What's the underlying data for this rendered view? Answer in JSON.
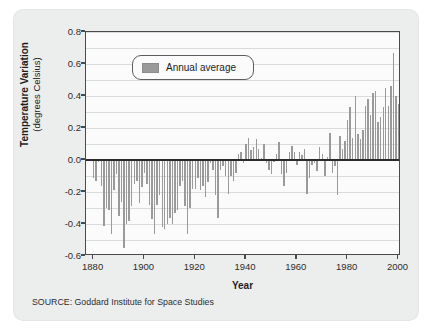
{
  "figure": {
    "source_note": "SOURCE: Goddard Institute for Space Studies",
    "legend_label": "Annual average",
    "y_title_main": "Temperature Variation",
    "y_title_sub": "(degrees Celsius)",
    "x_title": "Year",
    "bar_color": "#9a9a9a",
    "zero_line_color": "#2b2b2b",
    "grid_color": "#d9dcdd",
    "card_color": "#eceded",
    "plot_bg": "#fbfbfb"
  },
  "chart_data": {
    "type": "bar",
    "title": "",
    "subtitle": "",
    "xlabel": "Year",
    "ylabel": "Temperature Variation (degrees Celsius)",
    "xlim": [
      1877,
      2001
    ],
    "ylim": [
      -0.6,
      0.8
    ],
    "ytick_labels": [
      "0.8",
      "0.6",
      "0.4",
      "0.2",
      "0.0",
      "-0.2",
      "-0.4",
      "-0.6"
    ],
    "ytick_values": [
      0.8,
      0.6,
      0.4,
      0.2,
      0.0,
      -0.2,
      -0.4,
      -0.6
    ],
    "xtick_labels": [
      "1880",
      "1900",
      "1920",
      "1940",
      "1960",
      "1980",
      "2000"
    ],
    "xtick_values": [
      1880,
      1900,
      1920,
      1940,
      1960,
      1980,
      2000
    ],
    "grid": true,
    "grid_step": 0.1,
    "legend": [
      "Annual average"
    ],
    "legend_position": "upper-left-inside",
    "series": [
      {
        "name": "Annual average",
        "color": "#9a9a9a",
        "x": [
          1880,
          1881,
          1882,
          1883,
          1884,
          1885,
          1886,
          1887,
          1888,
          1889,
          1890,
          1891,
          1892,
          1893,
          1894,
          1895,
          1896,
          1897,
          1898,
          1899,
          1900,
          1901,
          1902,
          1903,
          1904,
          1905,
          1906,
          1907,
          1908,
          1909,
          1910,
          1911,
          1912,
          1913,
          1914,
          1915,
          1916,
          1917,
          1918,
          1919,
          1920,
          1921,
          1922,
          1923,
          1924,
          1925,
          1926,
          1927,
          1928,
          1929,
          1930,
          1931,
          1932,
          1933,
          1934,
          1935,
          1936,
          1937,
          1938,
          1939,
          1940,
          1941,
          1942,
          1943,
          1944,
          1945,
          1946,
          1947,
          1948,
          1949,
          1950,
          1951,
          1952,
          1953,
          1954,
          1955,
          1956,
          1957,
          1958,
          1959,
          1960,
          1961,
          1962,
          1963,
          1964,
          1965,
          1966,
          1967,
          1968,
          1969,
          1970,
          1971,
          1972,
          1973,
          1974,
          1975,
          1976,
          1977,
          1978,
          1979,
          1980,
          1981,
          1982,
          1983,
          1984,
          1985,
          1986,
          1987,
          1988,
          1989,
          1990,
          1991,
          1992,
          1993,
          1994,
          1995,
          1996,
          1997,
          1998,
          1999,
          2000
        ],
        "values": [
          -0.11,
          -0.13,
          -0.01,
          -0.16,
          -0.41,
          -0.3,
          -0.31,
          -0.46,
          -0.19,
          -0.09,
          -0.35,
          -0.26,
          -0.55,
          -0.4,
          -0.38,
          -0.29,
          -0.15,
          -0.13,
          -0.27,
          -0.17,
          -0.08,
          -0.15,
          -0.28,
          -0.37,
          -0.46,
          -0.28,
          -0.22,
          -0.42,
          -0.43,
          -0.4,
          -0.36,
          -0.4,
          -0.33,
          -0.31,
          -0.16,
          -0.13,
          -0.29,
          -0.46,
          -0.3,
          -0.18,
          -0.18,
          -0.11,
          -0.19,
          -0.16,
          -0.23,
          -0.14,
          -0.02,
          -0.06,
          -0.22,
          -0.36,
          -0.06,
          -0.04,
          -0.1,
          -0.21,
          -0.1,
          -0.13,
          -0.08,
          0.04,
          0.05,
          -0.02,
          0.1,
          0.14,
          0.06,
          0.08,
          0.13,
          0.07,
          0.01,
          0.1,
          -0.02,
          -0.06,
          -0.09,
          -0.01,
          0.04,
          0.11,
          -0.09,
          -0.16,
          -0.08,
          0.05,
          0.09,
          0.05,
          -0.03,
          0.05,
          0.03,
          0.07,
          -0.21,
          -0.11,
          -0.03,
          -0.02,
          -0.07,
          0.08,
          0.04,
          -0.1,
          0.02,
          0.17,
          -0.08,
          -0.04,
          -0.22,
          0.15,
          0.07,
          0.12,
          0.25,
          0.33,
          0.14,
          0.4,
          0.16,
          0.13,
          0.19,
          0.34,
          0.38,
          0.28,
          0.42,
          0.43,
          0.24,
          0.27,
          0.33,
          0.45,
          0.34,
          0.46,
          0.67,
          0.4,
          0.35
        ]
      }
    ]
  }
}
